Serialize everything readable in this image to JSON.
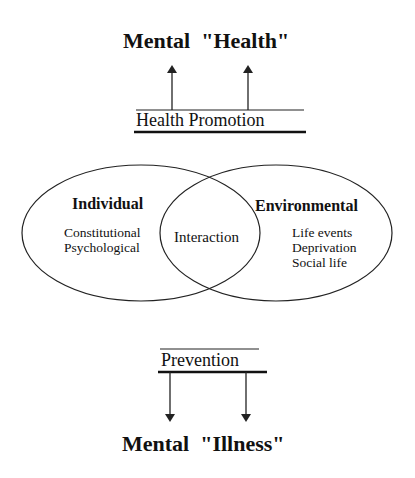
{
  "top": {
    "title_word1": "Mental",
    "title_word2": "\"Health\"",
    "promotion_label": "Health Promotion"
  },
  "venn": {
    "left": {
      "heading": "Individual",
      "items": [
        "Constitutional",
        "Psychological"
      ]
    },
    "overlap": {
      "label": "Interaction"
    },
    "right": {
      "heading": "Environmental",
      "items": [
        "Life events",
        "Deprivation",
        "Social life"
      ]
    }
  },
  "bottom": {
    "prevention_label": "Prevention",
    "title_word1": "Mental",
    "title_word2": "\"Illness\""
  },
  "colors": {
    "stroke": "#222222",
    "text": "#111111",
    "background": "#ffffff"
  }
}
